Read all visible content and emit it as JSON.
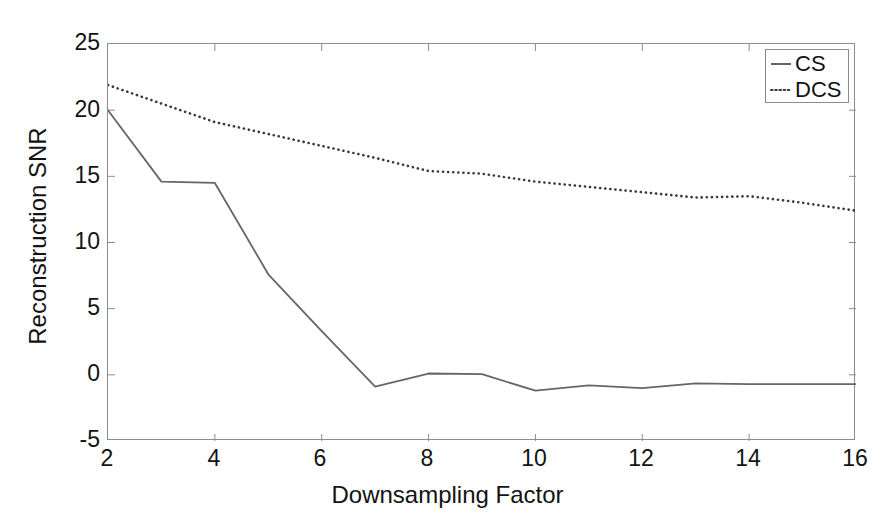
{
  "chart_data": {
    "type": "line",
    "title": "",
    "xlabel": "Downsampling Factor",
    "ylabel": "Reconstruction SNR",
    "xlim": [
      2,
      16
    ],
    "ylim": [
      -5,
      25
    ],
    "xticks": [
      2,
      4,
      6,
      8,
      10,
      12,
      14,
      16
    ],
    "xtick_labels": [
      "2",
      "4",
      "6",
      "8",
      "10",
      "12",
      "14",
      "16"
    ],
    "yticks": [
      -5,
      0,
      5,
      10,
      15,
      20,
      25
    ],
    "ytick_labels": [
      "-5",
      "0",
      "5",
      "10",
      "15",
      "20",
      "25"
    ],
    "grid": false,
    "legend_position": "upper right",
    "x": [
      2,
      3,
      4,
      5,
      6,
      7,
      8,
      9,
      10,
      11,
      12,
      13,
      14,
      15,
      16
    ],
    "series": [
      {
        "name": "CS",
        "style": "solid",
        "color": "#666666",
        "values": [
          20.0,
          14.6,
          14.5,
          7.6,
          3.3,
          -0.9,
          0.1,
          0.05,
          -1.2,
          -0.8,
          -1.0,
          -0.65,
          -0.7,
          -0.7,
          -0.7
        ]
      },
      {
        "name": "DCS",
        "style": "dotted",
        "color": "#3a3a3a",
        "values": [
          21.9,
          20.5,
          19.1,
          18.2,
          17.3,
          16.4,
          15.4,
          15.2,
          14.6,
          14.2,
          13.8,
          13.4,
          13.5,
          13.0,
          12.4
        ]
      }
    ]
  },
  "axes": {
    "x_title": "Downsampling Factor",
    "y_title": "Reconstruction SNR",
    "frame_color": "#8c8c8c"
  },
  "legend": {
    "entries": [
      {
        "label": "CS",
        "style": "solid"
      },
      {
        "label": "DCS",
        "style": "dotted"
      }
    ]
  }
}
